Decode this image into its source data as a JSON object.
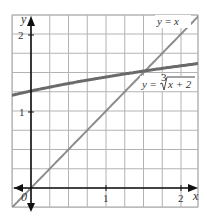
{
  "chart_data": {
    "type": "line",
    "title": "",
    "xlabel": "x",
    "ylabel": "y",
    "xlim": [
      -0.25,
      2.25
    ],
    "ylim": [
      -0.25,
      2.25
    ],
    "grid": true,
    "grid_step": 0.25,
    "x_ticks": [
      {
        "value": 1,
        "label": "1"
      },
      {
        "value": 2,
        "label": "2"
      }
    ],
    "y_ticks": [
      {
        "value": 1,
        "label": "1"
      },
      {
        "value": 2,
        "label": "2"
      }
    ],
    "origin_label": "0",
    "series": [
      {
        "name": "y = x",
        "label": "y = x",
        "function": "x",
        "color": "#8c8c8c",
        "width": 2,
        "x": [
          -0.25,
          0,
          0.5,
          1,
          1.5,
          2,
          2.2
        ],
        "y": [
          -0.25,
          0,
          0.5,
          1,
          1.5,
          2,
          2.2
        ]
      },
      {
        "name": "y = cbrt(x + 2)",
        "label": "y = ∛(x + 2)",
        "function": "cbrt(x+2)",
        "color": "#6a6a6a",
        "width": 3,
        "x": [
          -0.25,
          0,
          0.5,
          1,
          1.5,
          2,
          2.25
        ],
        "y": [
          1.21,
          1.26,
          1.36,
          1.44,
          1.52,
          1.59,
          1.62
        ]
      }
    ],
    "annotations": [
      {
        "text": "y = x",
        "near": [
          2.0,
          2.2
        ]
      },
      {
        "text": "y = ∛(x + 2)",
        "near": [
          1.5,
          1.3
        ]
      }
    ],
    "intersection": [
      1.52,
      1.52
    ]
  },
  "labels": {
    "x_axis": "x",
    "y_axis": "y",
    "origin": "0",
    "tick_x1": "1",
    "tick_x2": "2",
    "tick_y1": "1",
    "tick_y2": "2",
    "line_label_y": "y",
    "line_label_eq": "=",
    "line_label_x": "x",
    "curve_label_y": "y",
    "curve_label_eq": "=",
    "curve_label_index": "3",
    "curve_label_radicand": "x + 2"
  }
}
